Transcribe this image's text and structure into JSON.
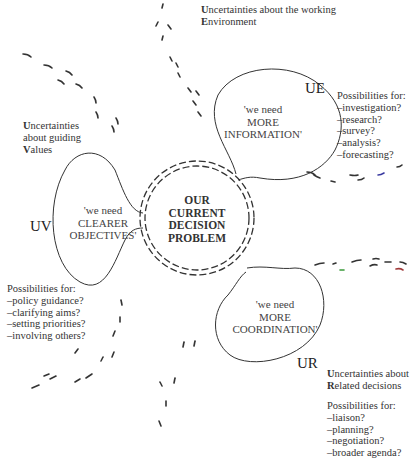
{
  "center": {
    "lines": [
      "OUR",
      "CURRENT",
      "DECISION",
      "PROBLEM"
    ]
  },
  "ue": {
    "tag": "UE",
    "bubble": [
      "'we need",
      "MORE",
      "INFORMATION'"
    ],
    "heading_line1_cap": "U",
    "heading_line1_rest": "ncertainties about the working",
    "heading_line2_cap": "E",
    "heading_line2_rest": "nvironment",
    "possibilities_title": "Possibilities for:",
    "possibilities": [
      "–investigation?",
      "–research?",
      "–survey?",
      "–analysis?",
      "–forecasting?"
    ]
  },
  "uv": {
    "tag": "UV",
    "bubble": [
      "'we need",
      "CLEARER",
      "OBJECTIVES'"
    ],
    "heading_line1_cap": "U",
    "heading_line1_rest": "ncertainties",
    "heading_line2": "about guiding",
    "heading_line3_cap": "V",
    "heading_line3_rest": "alues",
    "possibilities_title": "Possibilities for:",
    "possibilities": [
      "–policy guidance?",
      "–clarifying aims?",
      "–setting priorities?",
      "–involving others?"
    ]
  },
  "ur": {
    "tag": "UR",
    "bubble": [
      "'we need",
      "MORE",
      "COORDINATION'"
    ],
    "heading_line1_cap": "U",
    "heading_line1_rest": "ncertainties about",
    "heading_line2_cap": "R",
    "heading_line2_rest": "elated decisions",
    "possibilities_title": "Possibilities for:",
    "possibilities": [
      "–liaison?",
      "–planning?",
      "–negotiation?",
      "–broader agenda?"
    ]
  },
  "colors": {
    "line": "#333333",
    "accent_blue": "#3a3aa0",
    "accent_green": "#3a9a3a",
    "accent_red": "#a03a3a"
  }
}
